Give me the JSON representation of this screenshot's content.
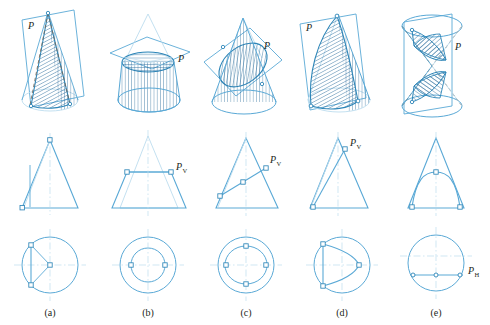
{
  "figure": {
    "colors": {
      "line": "#5aa9d6",
      "line_dark": "#2e86b8",
      "hatch": "#2e6f9e",
      "construction": "#bcdcee",
      "hidden": "#7a6a5a",
      "text": "#231f20",
      "background": "#ffffff"
    },
    "rows": [
      {
        "name": "pictorial-views",
        "description": "Pictorial (isometric) views of cone with cutting plane P"
      },
      {
        "name": "front-views",
        "description": "Front views showing edge view of cutting plane PV"
      },
      {
        "name": "top-views",
        "description": "Top views showing circular base and the cut"
      }
    ],
    "panels": [
      {
        "id": "a",
        "caption": "(a)",
        "section_name": "triangle",
        "pictorial_label": "P",
        "front_label": "",
        "front_sub": "",
        "top_label": "",
        "top_sub": ""
      },
      {
        "id": "b",
        "caption": "(b)",
        "section_name": "circle",
        "pictorial_label": "P",
        "front_label": "P",
        "front_sub": "V",
        "top_label": "",
        "top_sub": ""
      },
      {
        "id": "c",
        "caption": "(c)",
        "section_name": "ellipse",
        "pictorial_label": "P",
        "front_label": "P",
        "front_sub": "V",
        "top_label": "",
        "top_sub": ""
      },
      {
        "id": "d",
        "caption": "(d)",
        "section_name": "parabola",
        "pictorial_label": "P",
        "front_label": "P",
        "front_sub": "V",
        "top_label": "",
        "top_sub": ""
      },
      {
        "id": "e",
        "caption": "(e)",
        "section_name": "hyperbola",
        "pictorial_label": "P",
        "front_label": "",
        "front_sub": "",
        "top_label": "P",
        "top_sub": "H"
      }
    ]
  }
}
